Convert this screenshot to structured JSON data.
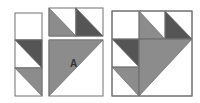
{
  "diagram": {
    "colors": {
      "background": "#ffffff",
      "border": "#707070",
      "dark": "#555555",
      "medium": "#8c8c8c",
      "light": "#ffffff"
    },
    "groups": [
      {
        "name": "left-strip",
        "squares": [
          {
            "x": 15,
            "y": 13,
            "w": 27,
            "h": 27,
            "triangle": null
          },
          {
            "x": 15,
            "y": 40,
            "w": 27,
            "h": 28,
            "triangle": {
              "points": "15,40 42,40 42,68",
              "fill": "dark"
            }
          },
          {
            "x": 15,
            "y": 68,
            "w": 27,
            "h": 28,
            "triangle": {
              "points": "15,68 42,68 42,96",
              "fill": "medium"
            }
          }
        ]
      },
      {
        "name": "middle-pieces",
        "squares": [
          {
            "x": 49,
            "y": 8,
            "w": 27,
            "h": 28,
            "triangle": {
              "points": "49,8 49,36 76,36",
              "fill": "medium"
            }
          },
          {
            "x": 76,
            "y": 8,
            "w": 27,
            "h": 28,
            "triangle": {
              "points": "76,8 76,36 103,36",
              "fill": "dark"
            }
          },
          {
            "x": 49,
            "y": 40,
            "w": 54,
            "h": 56,
            "triangle": {
              "points": "49,40 103,40 49,96",
              "fill": "medium"
            }
          }
        ],
        "label": {
          "text": "A",
          "x": 70,
          "y": 67
        }
      },
      {
        "name": "assembled-block",
        "outline": {
          "x": 112,
          "y": 11,
          "w": 80,
          "h": 85
        },
        "triangles": [
          {
            "points": "139,11 139,39 165,39",
            "fill": "medium"
          },
          {
            "points": "165,11 165,39 192,39",
            "fill": "dark"
          },
          {
            "points": "112,39 139,39 139,67",
            "fill": "dark"
          },
          {
            "points": "112,67 139,67 139,96",
            "fill": "medium"
          },
          {
            "points": "139,39 192,39 139,96",
            "fill": "medium"
          }
        ],
        "lines": [
          {
            "x1": 139,
            "y1": 11,
            "x2": 139,
            "y2": 96
          },
          {
            "x1": 112,
            "y1": 39,
            "x2": 192,
            "y2": 39
          },
          {
            "x1": 112,
            "y1": 67,
            "x2": 139,
            "y2": 67
          },
          {
            "x1": 165,
            "y1": 11,
            "x2": 165,
            "y2": 39
          }
        ]
      }
    ]
  }
}
